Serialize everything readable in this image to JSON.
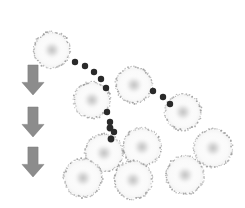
{
  "figure": {
    "background_color": "#ffffff",
    "width": 245,
    "height": 208,
    "caption": ""
  },
  "style": {
    "vesicle_rim_color": "#9a9a9a",
    "vesicle_fill_color": "#fbfbfb",
    "vesicle_nucleus_color": "#c9c9c9",
    "particle_color": "#2b2b2b",
    "arrow_color": "#8c8c8c",
    "arrow_edge_color": "#7a7a7a"
  },
  "arrows": {
    "group_name": "time-progression-arrows",
    "direction": "down",
    "count": 3,
    "color": "#8c8c8c",
    "items": [
      {
        "label": "arrow-1",
        "cx": 33,
        "cy": 80,
        "width": 22,
        "height": 30
      },
      {
        "label": "arrow-2",
        "cx": 33,
        "cy": 122,
        "width": 22,
        "height": 30
      },
      {
        "label": "arrow-3",
        "cx": 33,
        "cy": 162,
        "width": 22,
        "height": 30
      }
    ]
  },
  "vesicles": {
    "group_name": "vesicle-circles",
    "count": 10,
    "items": [
      {
        "label": "vesicle-1",
        "cx": 52,
        "cy": 50,
        "r": 18,
        "nucleus_r": 6
      },
      {
        "label": "vesicle-2",
        "cx": 92,
        "cy": 100,
        "r": 18,
        "nucleus_r": 6
      },
      {
        "label": "vesicle-3",
        "cx": 134,
        "cy": 85,
        "r": 18,
        "nucleus_r": 6
      },
      {
        "label": "vesicle-4",
        "cx": 183,
        "cy": 112,
        "r": 18,
        "nucleus_r": 6
      },
      {
        "label": "vesicle-5",
        "cx": 104,
        "cy": 153,
        "r": 19,
        "nucleus_r": 6
      },
      {
        "label": "vesicle-6",
        "cx": 142,
        "cy": 147,
        "r": 19,
        "nucleus_r": 6
      },
      {
        "label": "vesicle-7",
        "cx": 83,
        "cy": 178,
        "r": 19,
        "nucleus_r": 6
      },
      {
        "label": "vesicle-8",
        "cx": 133,
        "cy": 180,
        "r": 19,
        "nucleus_r": 6
      },
      {
        "label": "vesicle-9",
        "cx": 213,
        "cy": 148,
        "r": 19,
        "nucleus_r": 6
      },
      {
        "label": "vesicle-10",
        "cx": 185,
        "cy": 175,
        "r": 19,
        "nucleus_r": 6
      }
    ]
  },
  "particle_trail": {
    "group_name": "particle-dot-trail",
    "color": "#2b2b2b",
    "segments": [
      {
        "label": "trail-segment-1",
        "from": "vesicle-1",
        "to": "vesicle-2",
        "dots": [
          {
            "cx": 75,
            "cy": 62,
            "r": 3.2
          },
          {
            "cx": 85,
            "cy": 66,
            "r": 3.2
          },
          {
            "cx": 94,
            "cy": 72,
            "r": 3.2
          },
          {
            "cx": 101,
            "cy": 79,
            "r": 3.2
          },
          {
            "cx": 106,
            "cy": 88,
            "r": 3.2
          }
        ]
      },
      {
        "label": "trail-segment-2",
        "from": "vesicle-2",
        "to": "vesicle-3",
        "dots": [
          {
            "cx": 107,
            "cy": 112,
            "r": 3.2
          },
          {
            "cx": 110,
            "cy": 122,
            "r": 3.2
          },
          {
            "cx": 114,
            "cy": 132,
            "r": 3.2
          }
        ]
      },
      {
        "label": "trail-segment-3",
        "from": "vesicle-3",
        "to": "vesicle-4",
        "dots": [
          {
            "cx": 153,
            "cy": 91,
            "r": 3.2
          },
          {
            "cx": 163,
            "cy": 97,
            "r": 3.2
          },
          {
            "cx": 170,
            "cy": 104,
            "r": 3.2
          }
        ]
      },
      {
        "label": "trail-segment-4",
        "from": "vesicle-2",
        "to": "cluster",
        "dots": [
          {
            "cx": 110,
            "cy": 128,
            "r": 3.4
          },
          {
            "cx": 111,
            "cy": 139,
            "r": 3.4
          }
        ]
      }
    ]
  }
}
